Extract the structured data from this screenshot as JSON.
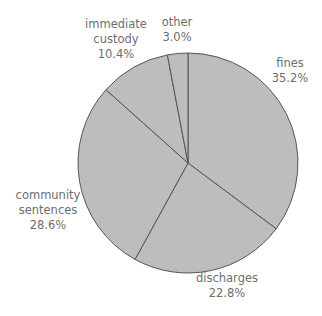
{
  "chart_data": {
    "type": "pie",
    "title": "",
    "start_angle_deg": 0,
    "direction": "clockwise",
    "slices": [
      {
        "label": "fines",
        "value": 35.2,
        "value_label": "35.2%"
      },
      {
        "label": "discharges",
        "value": 22.8,
        "value_label": "22.8%"
      },
      {
        "label": "community sentences",
        "value": 28.6,
        "value_label": "28.6%"
      },
      {
        "label": "immediate custody",
        "value": 10.4,
        "value_label": "10.4%"
      },
      {
        "label": "other",
        "value": 3.0,
        "value_label": "3.0%"
      }
    ],
    "colors": {
      "fill": "#bdbdbd",
      "stroke": "#555555",
      "text": "#6e6e6e"
    },
    "legend": "none"
  },
  "labels": {
    "fines": {
      "name": "fines",
      "pct": "35.2%"
    },
    "discharges": {
      "name": "discharges",
      "pct": "22.8%"
    },
    "community": {
      "line1": "community",
      "line2": "sentences",
      "pct": "28.6%"
    },
    "custody": {
      "line1": "immediate",
      "line2": "custody",
      "pct": "10.4%"
    },
    "other": {
      "name": "other",
      "pct": "3.0%"
    }
  }
}
